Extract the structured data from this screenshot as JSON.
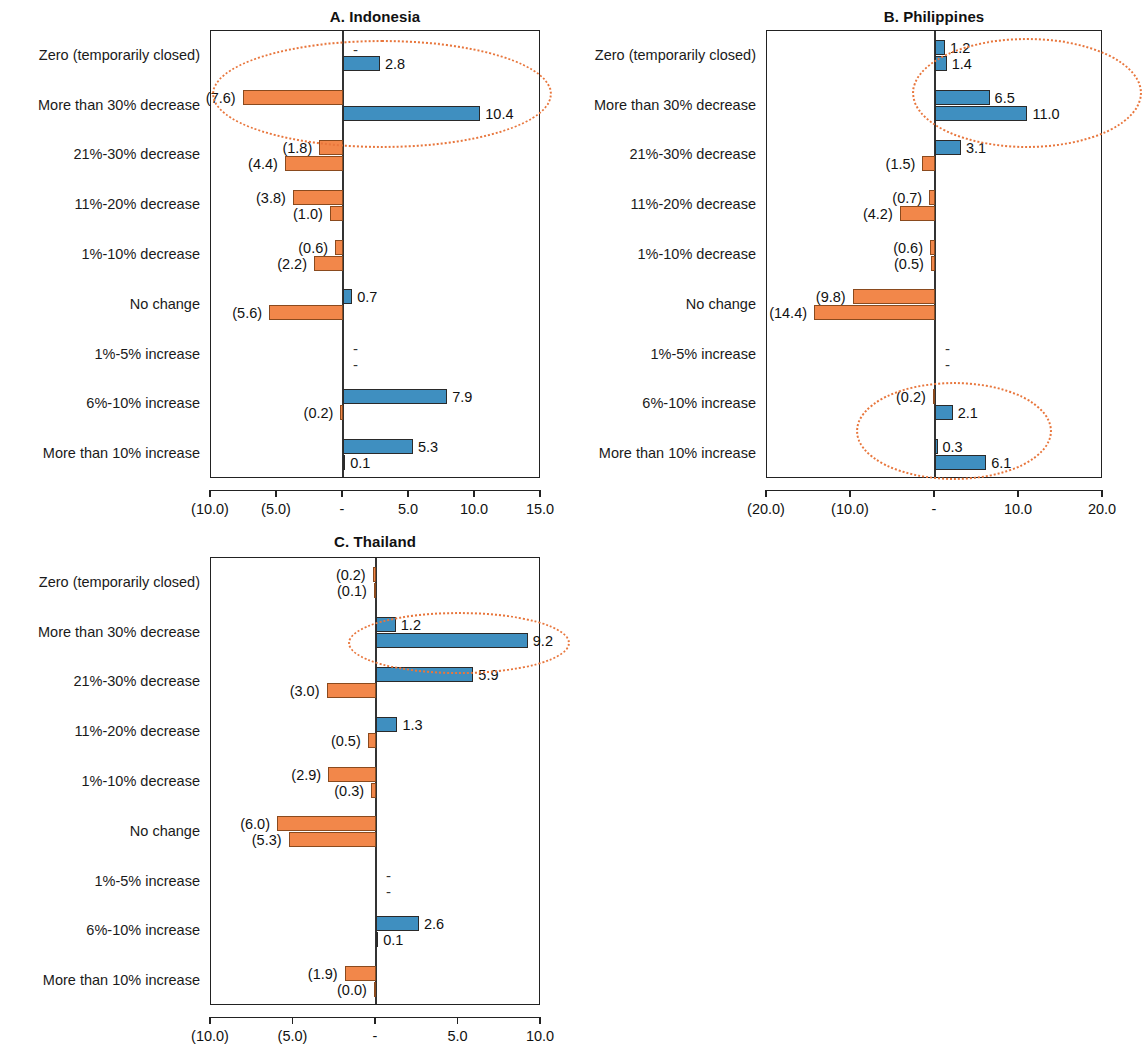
{
  "figure": {
    "categories": [
      "Zero (temporarily closed)",
      "More than 30% decrease",
      "21%-30% decrease",
      "11%-20% decrease",
      "1%-10% decrease",
      "No change",
      "1%-5% increase",
      "6%-10% increase",
      "More than 10% increase"
    ],
    "colors": {
      "series_a": "#3f8fc0",
      "series_b": "#f2874a",
      "highlight_ellipse": "#e8763c",
      "axis": "#222222"
    }
  },
  "chart_data": [
    {
      "type": "bar",
      "title": "A. Indonesia",
      "orientation": "horizontal",
      "grouped": true,
      "xlabel": "",
      "ylabel": "",
      "xlim": [
        -10.0,
        15.0
      ],
      "grid": false,
      "legend": null,
      "categories": [
        "Zero (temporarily closed)",
        "More than 30% decrease",
        "21%-30% decrease",
        "11%-20% decrease",
        "1%-10% decrease",
        "No change",
        "1%-5% increase",
        "6%-10% increase",
        "More than 10% increase"
      ],
      "tick_values": [
        -10.0,
        -5.0,
        0.0,
        5.0,
        10.0,
        15.0
      ],
      "tick_labels": [
        "(10.0)",
        "(5.0)",
        "-",
        "5.0",
        "10.0",
        "15.0"
      ],
      "series": [
        {
          "name": "upper",
          "values": [
            0.0,
            -7.6,
            -1.8,
            -3.8,
            -0.6,
            0.7,
            0.0,
            7.9,
            5.3
          ],
          "labels": [
            "-",
            "(7.6)",
            "(1.8)",
            "(3.8)",
            "(0.6)",
            "0.7",
            "-",
            "7.9",
            "5.3"
          ]
        },
        {
          "name": "lower",
          "values": [
            2.8,
            10.4,
            -4.4,
            -1.0,
            -2.2,
            -5.6,
            0.0,
            -0.2,
            0.1
          ],
          "labels": [
            "2.8",
            "10.4",
            "(4.4)",
            "(1.0)",
            "(2.2)",
            "(5.6)",
            "-",
            "(0.2)",
            "0.1"
          ]
        }
      ],
      "highlight": {
        "categories": [
          "Zero (temporarily closed)",
          "More than 30% decrease"
        ]
      }
    },
    {
      "type": "bar",
      "title": "B. Philippines",
      "orientation": "horizontal",
      "grouped": true,
      "xlabel": "",
      "ylabel": "",
      "xlim": [
        -20.0,
        20.0
      ],
      "grid": false,
      "legend": null,
      "categories": [
        "Zero (temporarily closed)",
        "More than 30% decrease",
        "21%-30% decrease",
        "11%-20% decrease",
        "1%-10% decrease",
        "No change",
        "1%-5% increase",
        "6%-10% increase",
        "More than 10% increase"
      ],
      "tick_values": [
        -20.0,
        -10.0,
        0.0,
        10.0,
        20.0
      ],
      "tick_labels": [
        "(20.0)",
        "(10.0)",
        "-",
        "10.0",
        "20.0"
      ],
      "series": [
        {
          "name": "upper",
          "values": [
            1.2,
            6.5,
            3.1,
            -0.7,
            -0.6,
            -9.8,
            0.0,
            -0.2,
            0.3
          ],
          "labels": [
            "1.2",
            "6.5",
            "3.1",
            "(0.7)",
            "(0.6)",
            "(9.8)",
            "-",
            "(0.2)",
            "0.3"
          ]
        },
        {
          "name": "lower",
          "values": [
            1.4,
            11.0,
            -1.5,
            -4.2,
            -0.5,
            -14.4,
            0.0,
            2.1,
            6.1
          ],
          "labels": [
            "1.4",
            "11.0",
            "(1.5)",
            "(4.2)",
            "(0.5)",
            "(14.4)",
            "-",
            "2.1",
            "6.1"
          ]
        }
      ],
      "highlight": {
        "categories": [
          "Zero (temporarily closed)",
          "More than 30% decrease",
          "6%-10% increase",
          "More than 10% increase"
        ]
      }
    },
    {
      "type": "bar",
      "title": "C. Thailand",
      "orientation": "horizontal",
      "grouped": true,
      "xlabel": "",
      "ylabel": "",
      "xlim": [
        -10.0,
        10.0
      ],
      "grid": false,
      "legend": null,
      "categories": [
        "Zero (temporarily closed)",
        "More than 30% decrease",
        "21%-30% decrease",
        "11%-20% decrease",
        "1%-10% decrease",
        "No change",
        "1%-5% increase",
        "6%-10% increase",
        "More than 10% increase"
      ],
      "tick_values": [
        -10.0,
        -5.0,
        0.0,
        5.0,
        10.0
      ],
      "tick_labels": [
        "(10.0)",
        "(5.0)",
        "-",
        "5.0",
        "10.0"
      ],
      "series": [
        {
          "name": "upper",
          "values": [
            -0.2,
            1.2,
            5.9,
            1.3,
            -2.9,
            -6.0,
            0.0,
            2.6,
            -1.9
          ],
          "labels": [
            "(0.2)",
            "1.2",
            "5.9",
            "1.3",
            "(2.9)",
            "(6.0)",
            "-",
            "2.6",
            "(1.9)"
          ]
        },
        {
          "name": "lower",
          "values": [
            -0.1,
            9.2,
            -3.0,
            -0.5,
            -0.3,
            -5.3,
            0.0,
            0.1,
            -0.04
          ],
          "labels": [
            "(0.1)",
            "9.2",
            "(3.0)",
            "(0.5)",
            "(0.3)",
            "(5.3)",
            "-",
            "0.1",
            "(0.0)"
          ]
        }
      ],
      "highlight": {
        "categories": [
          "More than 30% decrease"
        ]
      }
    }
  ]
}
